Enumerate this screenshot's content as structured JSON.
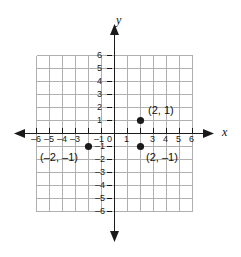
{
  "figure": {
    "type": "coordinate-plane",
    "background_color": "#ffffff",
    "grid_color": "#b0b0b0",
    "axis_color": "#1a1a1a",
    "point_color": "#1a1a1a",
    "axis_names": {
      "x": "x",
      "y": "y"
    },
    "x_axis": {
      "min": -6,
      "max": 6,
      "ticks": [
        {
          "value": -6,
          "label": "–6"
        },
        {
          "value": -5,
          "label": "–5"
        },
        {
          "value": -4,
          "label": "–4"
        },
        {
          "value": -3,
          "label": "–3"
        },
        {
          "value": -1,
          "label": "–1"
        },
        {
          "value": 1,
          "label": "1"
        },
        {
          "value": 3,
          "label": "3"
        },
        {
          "value": 4,
          "label": "4"
        },
        {
          "value": 5,
          "label": "5"
        },
        {
          "value": 6,
          "label": "6"
        }
      ]
    },
    "y_axis": {
      "min": -6,
      "max": 6,
      "origin_label": "0",
      "ticks": [
        {
          "value": 6,
          "label": "6"
        },
        {
          "value": 5,
          "label": "5"
        },
        {
          "value": 4,
          "label": "4"
        },
        {
          "value": 3,
          "label": "3"
        },
        {
          "value": 2,
          "label": "2"
        },
        {
          "value": 1,
          "label": "1"
        },
        {
          "value": -1,
          "label": "–1"
        },
        {
          "value": -2,
          "label": "–2"
        },
        {
          "value": -3,
          "label": "–3"
        },
        {
          "value": -4,
          "label": "–4"
        },
        {
          "value": -5,
          "label": "–5"
        },
        {
          "value": -6,
          "label": "–6"
        }
      ]
    },
    "points": [
      {
        "name": "point-2-1",
        "x": 2,
        "y": 1,
        "label": "(2, 1)",
        "label_dx": 8,
        "label_dy": -15
      },
      {
        "name": "point-2-neg1",
        "x": 2,
        "y": -1,
        "label": "(2, –1)",
        "label_dx": 8,
        "label_dy": 8
      },
      {
        "name": "point-neg2-neg1",
        "x": -2,
        "y": -1,
        "label": "(–2, –1)",
        "label_dx": -60,
        "label_dy": 8
      }
    ]
  }
}
